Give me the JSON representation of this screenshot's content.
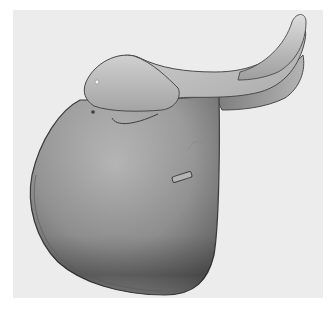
{
  "image": {
    "subject": "english-saddle",
    "colors": {
      "page_background": "#ffffff",
      "panel_background": "#ececec",
      "leather_light": "#d2d2d2",
      "leather_mid": "#a8a8a8",
      "leather_dark": "#6e6e6e",
      "outline": "#4a4a4a"
    }
  }
}
